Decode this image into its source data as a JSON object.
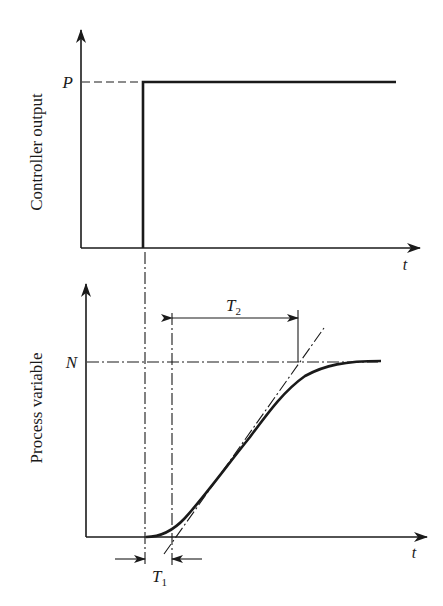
{
  "diagram": {
    "title": "",
    "type": "step-response / process reaction curve",
    "top_panel": {
      "ylabel": "Controller output",
      "xlabel": "t",
      "level_label": "P"
    },
    "bottom_panel": {
      "ylabel": "Process variable",
      "xlabel": "t",
      "level_label": "N",
      "dimension_labels": {
        "t1_main": "T",
        "t1_sub": "1",
        "t2_main": "T",
        "t2_sub": "2"
      }
    },
    "colors": {
      "ink": "#1a1a1a",
      "background": "#ffffff"
    }
  }
}
